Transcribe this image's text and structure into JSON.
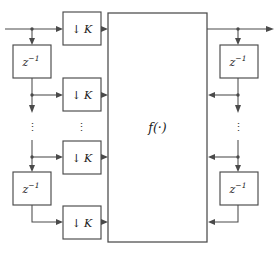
{
  "figure": {
    "type": "block-diagram",
    "title": "",
    "background_color": "#ffffff",
    "line_color": "#4a4a4a",
    "text_color": "#1a1a1a",
    "width": 278,
    "height": 255
  },
  "labels": {
    "downsampler": "K",
    "downsample_arrow": "↓",
    "delay_base": "z",
    "delay_exponent": "−1",
    "function_block": "f(·)",
    "vertical_ellipsis": "⋮"
  },
  "blocks": {
    "center": {
      "label": "f(·)",
      "x": 108,
      "y": 13,
      "w": 99,
      "h": 229
    },
    "downsamplers": [
      {
        "name": "downsample-block-1",
        "label_arrow": "↓",
        "label_gain": "K",
        "x": 63,
        "y": 12,
        "w": 38,
        "h": 33
      },
      {
        "name": "downsample-block-2",
        "label_arrow": "↓",
        "label_gain": "K",
        "x": 63,
        "y": 78,
        "w": 38,
        "h": 33
      },
      {
        "name": "downsample-block-3",
        "label_arrow": "↓",
        "label_gain": "K",
        "x": 63,
        "y": 141,
        "w": 38,
        "h": 33
      },
      {
        "name": "downsample-block-4",
        "label_arrow": "↓",
        "label_gain": "K",
        "x": 63,
        "y": 206,
        "w": 38,
        "h": 33
      }
    ],
    "delays_left": [
      {
        "name": "delay-block-left-top",
        "label": "z",
        "exponent": "−1",
        "x": 13,
        "y": 45,
        "w": 38,
        "h": 33
      },
      {
        "name": "delay-block-left-bottom",
        "label": "z",
        "exponent": "−1",
        "x": 13,
        "y": 172,
        "w": 38,
        "h": 33
      }
    ],
    "delays_right": [
      {
        "name": "delay-block-right-top",
        "label": "z",
        "exponent": "−1",
        "x": 220,
        "y": 45,
        "w": 38,
        "h": 33
      },
      {
        "name": "delay-block-right-bottom",
        "label": "z",
        "exponent": "−1",
        "x": 220,
        "y": 172,
        "w": 38,
        "h": 33
      }
    ]
  },
  "ellipses": [
    {
      "name": "ellipsis-left-delay-column",
      "x": 32,
      "y": 128
    },
    {
      "name": "ellipsis-left-downsample-column",
      "x": 81,
      "y": 128
    },
    {
      "name": "ellipsis-right-delay-column",
      "x": 238,
      "y": 128
    }
  ]
}
